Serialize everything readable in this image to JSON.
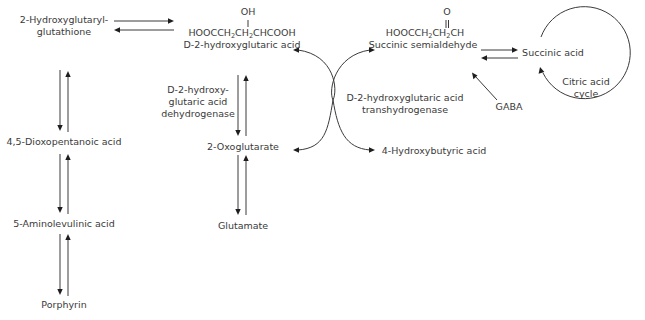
{
  "diagram": {
    "nodes": {
      "hydroxyglutaryl_glutathione": {
        "line1": "2-Hydroxyglutaryl-",
        "line2": "glutathione"
      },
      "dioxopentanoic_acid": {
        "label": "4,5-Dioxopentanoic acid"
      },
      "aminolevulinic_acid": {
        "label": "5-Aminolevulinic acid"
      },
      "porphyrin": {
        "label": "Porphyrin"
      },
      "d2hg": {
        "oh": "OH",
        "formula_a": "HOOCCH",
        "formula_b": "CH",
        "formula_c": "CHCOOH",
        "sub": "2",
        "name": "D-2-hydroxyglutaric acid"
      },
      "oxoglutarate": {
        "label": "2-Oxoglutarate"
      },
      "glutamate": {
        "label": "Glutamate"
      },
      "succinic_semialdehyde": {
        "o": "O",
        "formula_a": "HOOCCH",
        "formula_b": "CH",
        "formula_c": "CH",
        "sub": "2",
        "name": "Succinic semialdehyde"
      },
      "hydroxybutyric_acid": {
        "label": "4-Hydroxybutyric acid"
      },
      "succinic_acid": {
        "label": "Succinic acid"
      },
      "gaba": {
        "label": "GABA"
      },
      "citric_acid_cycle": {
        "line1": "Citric acid",
        "line2": "cycle"
      }
    },
    "enzymes": {
      "dehydrogenase": {
        "line1": "D-2-hydroxy-",
        "line2": "glutaric acid",
        "line3": "dehydrogenase"
      },
      "transhydrogenase": {
        "line1": "D-2-hydroxyglutaric acid",
        "line2": "transhydrogenase"
      }
    },
    "edges": [
      {
        "from": "2-Hydroxyglutaryl-glutathione",
        "to": "D-2-hydroxyglutaric acid",
        "type": "reversible"
      },
      {
        "from": "2-Hydroxyglutaryl-glutathione",
        "to": "4,5-Dioxopentanoic acid",
        "type": "reversible"
      },
      {
        "from": "4,5-Dioxopentanoic acid",
        "to": "5-Aminolevulinic acid",
        "type": "reversible"
      },
      {
        "from": "5-Aminolevulinic acid",
        "to": "Porphyrin",
        "type": "reversible"
      },
      {
        "from": "D-2-hydroxyglutaric acid",
        "to": "2-Oxoglutarate",
        "type": "reversible",
        "enzyme": "D-2-hydroxyglutaric acid dehydrogenase"
      },
      {
        "from": "2-Oxoglutarate",
        "to": "Glutamate",
        "type": "reversible"
      },
      {
        "from": "Succinic semialdehyde",
        "to": "Succinic acid",
        "type": "reversible"
      },
      {
        "from": "GABA",
        "to": "Succinic semialdehyde",
        "type": "forward"
      },
      {
        "from": "Succinic semialdehyde",
        "to": "4-Hydroxybutyric acid",
        "type": "coupled",
        "enzyme": "D-2-hydroxyglutaric acid transhydrogenase"
      },
      {
        "from": "D-2-hydroxyglutaric acid",
        "to": "2-Oxoglutarate",
        "type": "coupled",
        "enzyme": "D-2-hydroxyglutaric acid transhydrogenase"
      },
      {
        "from": "Succinic acid",
        "to": "Succinic acid",
        "type": "cycle",
        "label": "Citric acid cycle"
      }
    ]
  }
}
